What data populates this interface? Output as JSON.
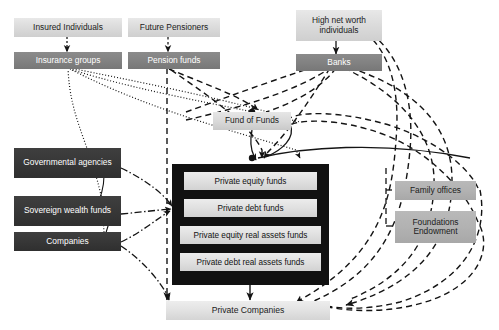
{
  "diagram": {
    "colors": {
      "light_box": "#dcdcdc",
      "mid_box": "#828282",
      "dark_box": "#373737",
      "grey_box": "#b2b2b2",
      "container_black": "#111111",
      "line": "#1a1a1a",
      "background": "#ffffff"
    },
    "nodes": {
      "insured_individuals": "Insured Individuals",
      "insurance_groups": "Insurance groups",
      "future_pensioners": "Future Pensioners",
      "pension_funds": "Pension funds",
      "high_net_worth": "High net worth individuals",
      "banks": "Banks",
      "fund_of_funds": "Fund of Funds",
      "governmental_agencies": "Governmental agencies",
      "sovereign_wealth_funds": "Sovereign wealth funds",
      "companies": "Companies",
      "family_offices": "Family offices",
      "foundations_endowment": "Foundations Endowment",
      "private_companies": "Private Companies"
    },
    "fund_container": {
      "funds": [
        "Private equity funds",
        "Private debt funds",
        "Private equity real assets funds",
        "Private debt real assets funds"
      ]
    },
    "edge_styles": {
      "solid": "solid arrow",
      "dotted": "dotted curve",
      "dashed": "dashed curve",
      "dash_dot": "dash-dot curve"
    }
  }
}
